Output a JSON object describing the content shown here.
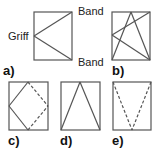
{
  "diagram": {
    "type": "window-opening-types",
    "panels": [
      {
        "id": "a",
        "label": "a)",
        "annotations": [
          "Griff",
          "Band",
          "Band"
        ],
        "description": "side-hung: lines from left middle (handle) to right corners (hinges)"
      },
      {
        "id": "b",
        "label": "b)",
        "description": "tilt-and-turn: triangle from top middle to bottom corners plus side-hung lines"
      },
      {
        "id": "c",
        "label": "c)",
        "description": "pivot: diamond connecting edge midpoints, right half dashed"
      },
      {
        "id": "d",
        "label": "d)",
        "description": "bottom-hung: lines from top middle to bottom corners"
      },
      {
        "id": "e",
        "label": "e)",
        "description": "top-hung: dashed lines from top corners to bottom middle"
      }
    ],
    "labels": {
      "griff": "Griff",
      "band_top": "Band",
      "band_bottom": "Band",
      "a": "a)",
      "b": "b)",
      "c": "c)",
      "d": "d)",
      "e": "e)"
    },
    "colors": {
      "stroke": "#555555",
      "text": "#222222"
    }
  }
}
